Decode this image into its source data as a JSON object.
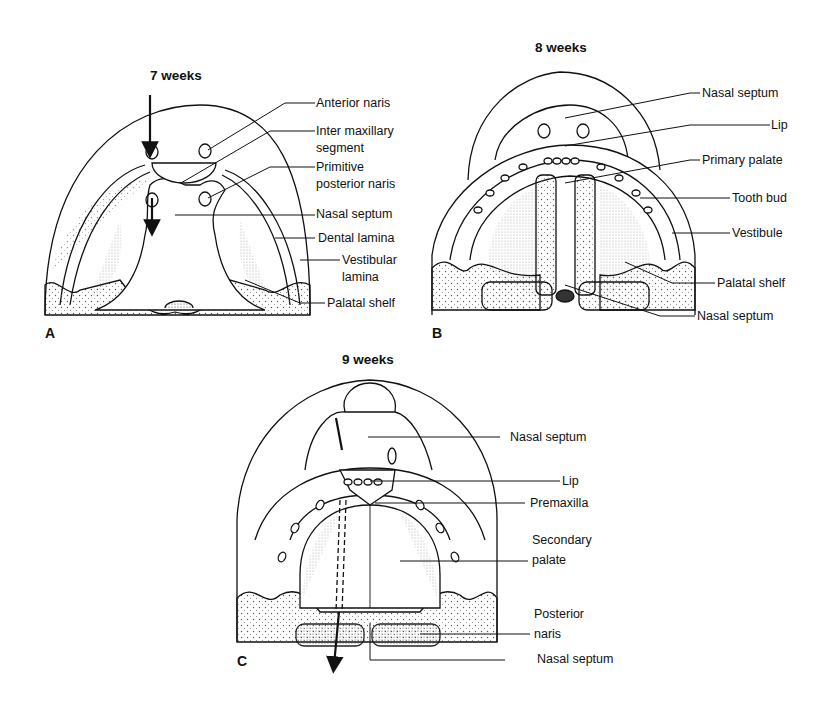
{
  "figure": {
    "panels": [
      {
        "id": "A",
        "title": "7 weeks",
        "labels": [
          "Anterior naris",
          "Inter maxillary",
          "segment",
          "Primitive",
          "posterior naris",
          "Nasal septum",
          "Dental lamina",
          "Vestibular",
          "lamina",
          "Palatal shelf"
        ]
      },
      {
        "id": "B",
        "title": "8 weeks",
        "labels": [
          "Nasal septum",
          "Lip",
          "Primary palate",
          "Tooth bud",
          "Vestibule",
          "Palatal shelf",
          "Nasal septum"
        ]
      },
      {
        "id": "C",
        "title": "9 weeks",
        "labels": [
          "Nasal septum",
          "Lip",
          "Premaxilla",
          "Secondary",
          "palate",
          "Posterior",
          "naris",
          "Nasal septum"
        ]
      }
    ]
  }
}
